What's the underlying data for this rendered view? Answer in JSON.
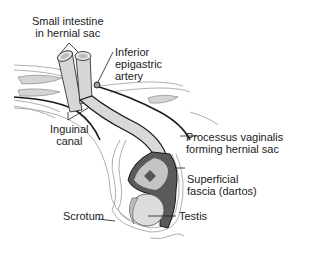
{
  "diagram": {
    "labels": {
      "small_intestine": {
        "line1": "Small intestine",
        "line2": "in hernial sac"
      },
      "inferior_epigastric": {
        "line1": "Inferior",
        "line2": "epigastric",
        "line3": "artery"
      },
      "inguinal_canal": {
        "line1": "Inguinal",
        "line2": "canal"
      },
      "processus_vaginalis": {
        "line1": "Processus vaginalis",
        "line2": "forming hernial sac"
      },
      "superficial_fascia": {
        "line1": "Superficial",
        "line2": "fascia (dartos)"
      },
      "scrotum": {
        "line1": "Scrotum"
      },
      "testis": {
        "line1": "Testis"
      }
    },
    "colors": {
      "outline": "#1a1a1a",
      "tissue_light": "#d9d9d9",
      "tissue_mid": "#bdbdbd",
      "sac_dark": "#5a5a5a",
      "fascia_lines": "#9a9a9a",
      "text": "#222222"
    }
  }
}
